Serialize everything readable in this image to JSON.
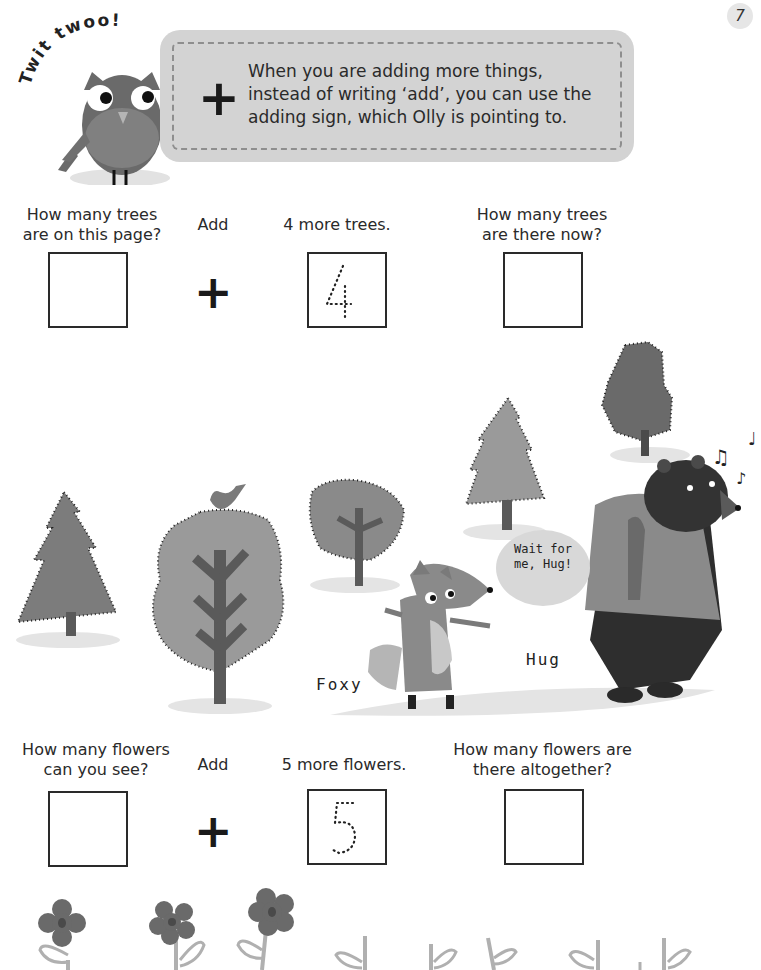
{
  "page": {
    "number": "7"
  },
  "owl": {
    "name": "Olly",
    "exclamation": "Twit twoo!"
  },
  "tip": {
    "symbol": "+",
    "text": "When you are adding more things, instead of writing ‘add’, you can use the adding sign, which Olly is pointing to."
  },
  "trees_problem": {
    "question_1": "How many trees are on this page?",
    "operator_label": "Add",
    "operator_symbol": "+",
    "addend_label": "4 more trees.",
    "addend_trace_digit": "4",
    "question_2": "How many trees are there now?"
  },
  "scene": {
    "speech_bubble": "Wait for me, Hug!",
    "characters": [
      "Foxy",
      "Hug"
    ],
    "music_notes": [
      "♫",
      "♩",
      "♪"
    ]
  },
  "flowers_problem": {
    "question_1": "How many flowers can you see?",
    "operator_label": "Add",
    "operator_symbol": "+",
    "addend_label": "5 more flowers.",
    "addend_trace_digit": "5",
    "question_2": "How many flowers are there altogether?"
  },
  "colors": {
    "tip_box_bg": "#d3d3d3",
    "tip_box_dash": "#8e8e8e",
    "tree_fill": "#8a8a8a",
    "shadow": "#e4e4e4",
    "bear": "#3a3a3a"
  }
}
